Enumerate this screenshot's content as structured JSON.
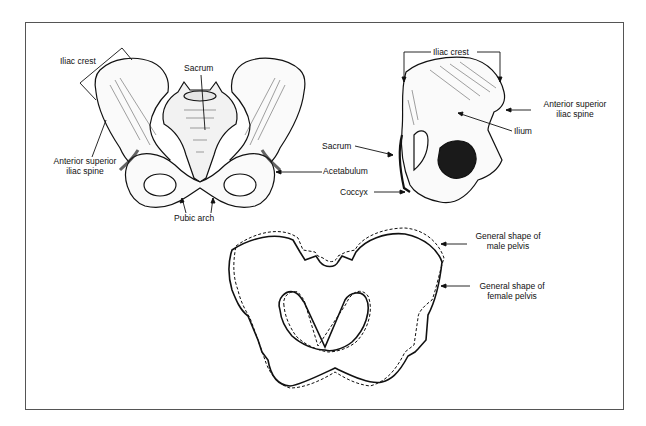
{
  "figure": {
    "panels": [
      {
        "name": "anterior-view",
        "description": "Front view of the pelvis"
      },
      {
        "name": "lateral-view",
        "description": "Side view of the hip bone"
      },
      {
        "name": "shape-comparison",
        "description": "Outline comparing male and female pelvis shapes"
      }
    ]
  },
  "labels": {
    "front": {
      "iliac_crest": "Iliac crest",
      "sacrum": "Sacrum",
      "asis_line1": "Anterior superior",
      "asis_line2": "iliac spine",
      "acetabulum": "Acetabulum",
      "pubic_arch": "Pubic arch"
    },
    "side": {
      "iliac_crest": "Iliac crest",
      "asis_line1": "Anterior superior",
      "asis_line2": "iliac spine",
      "ilium": "Ilium",
      "sacrum": "Sacrum",
      "coccyx": "Coccyx"
    },
    "shape": {
      "male_line1": "General shape of",
      "male_line2": "male pelvis",
      "female_line1": "General shape of",
      "female_line2": "female pelvis"
    }
  },
  "legend": {
    "male_style": "solid",
    "female_style": "dashed"
  }
}
